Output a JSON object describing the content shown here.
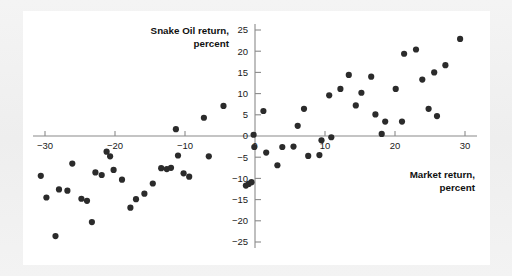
{
  "figure": {
    "background_color": "#f1f1f1",
    "card_color": "#ffffff",
    "axis_color": "#8a8a8a",
    "marker_color": "#2b2b2b"
  },
  "chart_data": {
    "type": "scatter",
    "title": "",
    "xlabel": "Market return, percent",
    "ylabel": "Snake Oil return, percent",
    "xlabel_line1": "Market return,",
    "xlabel_line2": "percent",
    "ylabel_line1": "Snake Oil return,",
    "ylabel_line2": "percent",
    "xlim": [
      -32,
      31
    ],
    "ylim": [
      -26,
      26
    ],
    "xticks": [
      -30,
      -20,
      -10,
      0,
      10,
      20,
      30
    ],
    "xtick_labels": [
      "−30",
      "−20",
      "−10",
      "0",
      "10",
      "20",
      "30"
    ],
    "yticks": [
      -25,
      -20,
      -15,
      -10,
      -5,
      0,
      5,
      10,
      15,
      20,
      25
    ],
    "ytick_labels": [
      "−25",
      "−20",
      "−15",
      "−10",
      "−5",
      "0",
      "5",
      "10",
      "15",
      "20",
      "25"
    ],
    "grid": false,
    "legend": null,
    "marker_size": 3.1,
    "points": [
      {
        "x": -30.6,
        "y": -9.4
      },
      {
        "x": -29.8,
        "y": -14.5
      },
      {
        "x": -28.5,
        "y": -23.6
      },
      {
        "x": -28.0,
        "y": -12.6
      },
      {
        "x": -26.8,
        "y": -12.9
      },
      {
        "x": -26.1,
        "y": -6.5
      },
      {
        "x": -24.8,
        "y": -14.8
      },
      {
        "x": -24.0,
        "y": -15.3
      },
      {
        "x": -23.3,
        "y": -20.3
      },
      {
        "x": -22.8,
        "y": -8.6
      },
      {
        "x": -21.9,
        "y": -9.2
      },
      {
        "x": -21.2,
        "y": -3.7
      },
      {
        "x": -20.7,
        "y": -4.8
      },
      {
        "x": -20.2,
        "y": -8.0
      },
      {
        "x": -19.0,
        "y": -10.3
      },
      {
        "x": -17.8,
        "y": -16.9
      },
      {
        "x": -17.0,
        "y": -14.9
      },
      {
        "x": -15.8,
        "y": -13.6
      },
      {
        "x": -14.6,
        "y": -11.2
      },
      {
        "x": -13.4,
        "y": -7.6
      },
      {
        "x": -12.6,
        "y": -7.8
      },
      {
        "x": -12.0,
        "y": -7.5
      },
      {
        "x": -11.3,
        "y": 1.6
      },
      {
        "x": -11.0,
        "y": -4.6
      },
      {
        "x": -10.2,
        "y": -8.8
      },
      {
        "x": -9.4,
        "y": -9.6
      },
      {
        "x": -7.3,
        "y": 4.3
      },
      {
        "x": -6.6,
        "y": -4.8
      },
      {
        "x": -4.5,
        "y": 7.1
      },
      {
        "x": -1.3,
        "y": -11.7
      },
      {
        "x": -0.9,
        "y": -11.3
      },
      {
        "x": -0.5,
        "y": -10.9
      },
      {
        "x": -0.2,
        "y": 0.3
      },
      {
        "x": -0.1,
        "y": -2.6
      },
      {
        "x": 1.2,
        "y": 5.9
      },
      {
        "x": 1.6,
        "y": -3.9
      },
      {
        "x": 3.2,
        "y": -6.9
      },
      {
        "x": 3.9,
        "y": -2.6
      },
      {
        "x": 5.5,
        "y": -2.5
      },
      {
        "x": 6.1,
        "y": 2.4
      },
      {
        "x": 7.0,
        "y": 6.4
      },
      {
        "x": 7.6,
        "y": -4.7
      },
      {
        "x": 9.2,
        "y": -4.5
      },
      {
        "x": 9.5,
        "y": -1.0
      },
      {
        "x": 10.6,
        "y": 9.6
      },
      {
        "x": 10.9,
        "y": -0.3
      },
      {
        "x": 12.2,
        "y": 11.1
      },
      {
        "x": 13.4,
        "y": 14.4
      },
      {
        "x": 14.4,
        "y": 7.2
      },
      {
        "x": 15.2,
        "y": 10.2
      },
      {
        "x": 16.6,
        "y": 14.0
      },
      {
        "x": 17.2,
        "y": 5.1
      },
      {
        "x": 18.1,
        "y": 0.5
      },
      {
        "x": 18.6,
        "y": 3.4
      },
      {
        "x": 20.1,
        "y": 11.1
      },
      {
        "x": 21.0,
        "y": 3.4
      },
      {
        "x": 21.3,
        "y": 19.4
      },
      {
        "x": 23.0,
        "y": 20.4
      },
      {
        "x": 23.9,
        "y": 13.3
      },
      {
        "x": 24.8,
        "y": 6.4
      },
      {
        "x": 25.6,
        "y": 15.0
      },
      {
        "x": 26.0,
        "y": 4.7
      },
      {
        "x": 27.2,
        "y": 16.7
      },
      {
        "x": 29.3,
        "y": 22.9
      }
    ]
  }
}
